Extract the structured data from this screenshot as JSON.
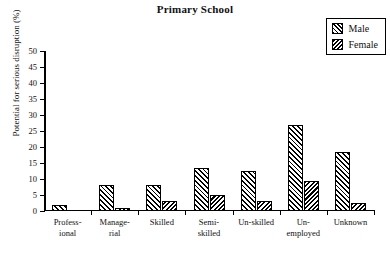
{
  "chart_data": {
    "type": "bar",
    "title": "Primary School",
    "xlabel": "",
    "ylabel": "Potential for serious disruption (%)",
    "ylim": [
      0,
      50
    ],
    "yticks": [
      0,
      5,
      10,
      15,
      20,
      25,
      30,
      35,
      40,
      45,
      50
    ],
    "grid": false,
    "legend_position": "top-right",
    "categories": [
      "Profess-\nional",
      "Manage-\nrial",
      "Skilled",
      "Semi-\nskilled",
      "Un-skilled",
      "Un-\nemployed",
      "Unknown"
    ],
    "category_lines": [
      [
        "Profess-",
        "ional"
      ],
      [
        "Manage-",
        "rial"
      ],
      [
        "Skilled",
        ""
      ],
      [
        "Semi-",
        "skilled"
      ],
      [
        "Un-skilled",
        ""
      ],
      [
        "Un-",
        "employed"
      ],
      [
        "Unknown",
        ""
      ]
    ],
    "series": [
      {
        "name": "Male",
        "values": [
          2,
          8,
          8,
          13.5,
          12.5,
          27,
          18.5
        ]
      },
      {
        "name": "Female",
        "values": [
          0,
          1,
          3,
          5,
          3,
          9.5,
          2.5
        ]
      }
    ]
  },
  "legend": {
    "items": [
      {
        "label": "Male",
        "pattern": "forward-hatch"
      },
      {
        "label": "Female",
        "pattern": "back-hatch"
      }
    ]
  }
}
